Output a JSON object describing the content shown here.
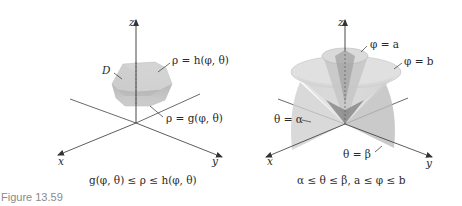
{
  "figure": {
    "caption": "Figure 13.59",
    "caption_color": "#8a8a8a"
  },
  "left_panel": {
    "axes": {
      "z": "z",
      "x": "x",
      "y": "y"
    },
    "region_label": "D",
    "outer_surface_label": "ρ = h(φ, θ)",
    "inner_surface_label": "ρ = g(φ, θ)",
    "inequality": "g(φ, θ) ≤ ρ ≤ h(φ, θ)"
  },
  "right_panel": {
    "axes": {
      "z": "z",
      "x": "x",
      "y": "y"
    },
    "inner_cone_label": "φ = a",
    "outer_cone_label": "φ = b",
    "plane_alpha_label": "θ = α",
    "plane_beta_label": "θ = β",
    "inequality": "α ≤ θ ≤ β, a ≤ φ ≤ b"
  },
  "colors": {
    "axis": "#333333",
    "surface_light": "#d9d9d9",
    "surface_mid": "#c2c2c2",
    "surface_dark": "#9a9a9a",
    "text": "#2a2a2a"
  }
}
